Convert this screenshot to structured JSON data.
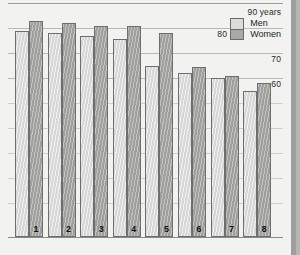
{
  "legend": {
    "items": [
      {
        "label": "Men",
        "color": "#dedede"
      },
      {
        "label": "Women",
        "color": "#a8a8a6"
      }
    ]
  },
  "axis": {
    "unit_label": "90 years",
    "ticks": [
      "90 years",
      "80",
      "70",
      "60"
    ]
  },
  "chart_data": {
    "type": "bar",
    "title": "",
    "subtitle": "",
    "xlabel": "",
    "ylabel": "90 years",
    "ylim": [
      16,
      90
    ],
    "grid": true,
    "legend_position": "top-right",
    "categories": [
      "1",
      "2",
      "3",
      "4",
      "5",
      "6",
      "7",
      "8"
    ],
    "tick_labels": [
      "90 years",
      "80",
      "70",
      "60"
    ],
    "tick_values": [
      90,
      80,
      70,
      60
    ],
    "series": [
      {
        "name": "Men",
        "values": [
          79,
          78,
          77,
          75.5,
          65,
          62,
          60,
          55
        ]
      },
      {
        "name": "Women",
        "values": [
          83,
          82,
          81,
          81,
          78,
          64.5,
          61,
          58
        ]
      }
    ],
    "annotations": []
  }
}
